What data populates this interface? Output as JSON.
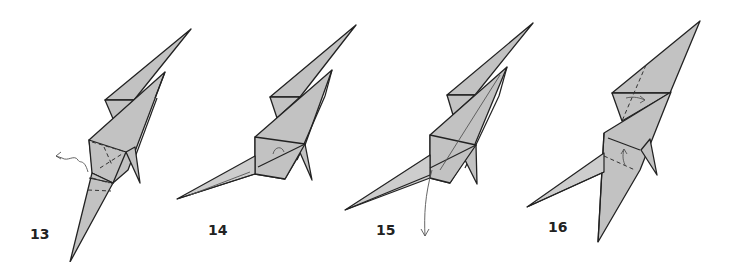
{
  "diagram": {
    "type": "origami-folding-sequence",
    "colors": {
      "paper": "#c2c2c2",
      "line": "#222222",
      "background": "#ffffff"
    },
    "steps": [
      {
        "number": "13",
        "description": "model with valley and mountain fold lines at base, push-in arrow on left"
      },
      {
        "number": "14",
        "description": "leg swung out to the left, small curved fold indicator"
      },
      {
        "number": "15",
        "description": "thin crease lines, long curved arrow pointing down"
      },
      {
        "number": "16",
        "description": "valley folds with arrows on upper and middle flaps"
      }
    ]
  }
}
